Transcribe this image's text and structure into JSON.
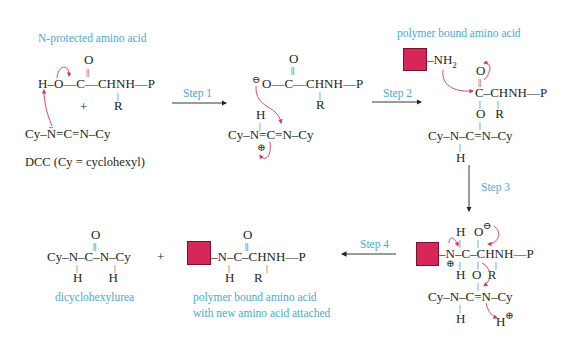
{
  "labels": {
    "n_protected": "N-protected amino acid",
    "polymer_bound": "polymer bound amino acid",
    "dcc_caption": "DCC (Cy = cyclohexyl)",
    "dicyclohexylurea": "dicyclohexylurea",
    "product_line1": "polymer bound amino acid",
    "product_line2": "with new amino acid attached"
  },
  "steps": {
    "step1": "Step 1",
    "step2": "Step 2",
    "step3": "Step 3",
    "step4": "Step 4"
  },
  "reactant_acid": {
    "carbonyl_o": "O",
    "dbl": "||",
    "main": "H–O—C—CHNH—P",
    "bond_r": "|",
    "r": "R",
    "plus": "+"
  },
  "reactant_dcc": {
    "main": "Cy–N̈=C=N–Cy"
  },
  "intermediate1": {
    "carbonyl_o": "O",
    "dbl": "||",
    "minus": "⊖",
    "main": "O—C—CHNH—P",
    "bond_r": "|",
    "r": "R",
    "h": "H",
    "bond_h": "|",
    "carbodiimide": "Cy–N=C=N–Cy",
    "plus_charge": "⊕"
  },
  "nucleophile": {
    "amine": "–NH",
    "sub2": "2",
    "lone_pair": ":"
  },
  "intermediate2": {
    "carbonyl_o": "O",
    "dbl": "||",
    "main": "C–CHNH—P",
    "bond": "|",
    "row3": "O   R",
    "row4": "Cy–N–C=N–Cy",
    "h": "H"
  },
  "intermediate3": {
    "h_top": "H",
    "o_top": "O",
    "minus": "⊖",
    "main": "–N–C–CHNH—P",
    "plus": "⊕",
    "row3": "H  O  R",
    "row4": "Cy–N–C=N–Cy",
    "h": "H",
    "h_plus": "H",
    "h_plus_charge": "⊕"
  },
  "product_urea": {
    "o": "O",
    "dbl": "||",
    "main": "Cy–N–C–N–Cy",
    "h_row": "H        H",
    "plus": "+"
  },
  "product_peptide": {
    "o": "O",
    "dbl": "||",
    "main": "–N–C–CHNH—P",
    "h_row": "H      R"
  },
  "colors": {
    "accent_label": "#4aa8d8",
    "resin": "#d7265a",
    "curved_arrow": "#d9365f",
    "text": "#231f20"
  }
}
